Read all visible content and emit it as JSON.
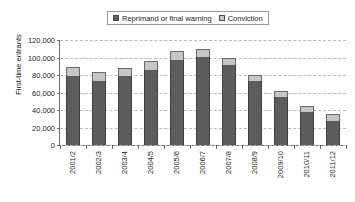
{
  "chart_data": {
    "type": "bar",
    "subtype": "stacked-bar",
    "title": "",
    "xlabel": "",
    "ylabel": "First-time entrants",
    "ylim": [
      0,
      120000
    ],
    "ytick_labels": [
      "120,000",
      "100,000",
      "80,000",
      "60,000",
      "40,000",
      "20,000",
      "0"
    ],
    "ytick_values": [
      120000,
      100000,
      80000,
      60000,
      40000,
      20000,
      0
    ],
    "grid": true,
    "legend_position": "top-center",
    "categories": [
      "2001/2",
      "2002/3",
      "2003/4",
      "2004/5",
      "2005/6",
      "2006/7",
      "2007/8",
      "2008/9",
      "2009/10",
      "2010/11",
      "2011/12"
    ],
    "series": [
      {
        "name": "Reprimand or final warning",
        "color": "#5d5d5d",
        "values": [
          79000,
          73000,
          79000,
          86000,
          97000,
          101000,
          91000,
          73000,
          55000,
          38000,
          28000
        ]
      },
      {
        "name": "Conviction",
        "color": "#c6c6c6",
        "values": [
          10000,
          10000,
          9000,
          10000,
          10000,
          9000,
          9000,
          7000,
          7000,
          7000,
          8000
        ]
      }
    ],
    "totals": [
      89000,
      83000,
      88000,
      96000,
      107000,
      110000,
      100000,
      80000,
      62000,
      45000,
      36000
    ]
  },
  "legend": {
    "items": [
      {
        "label": "Reprimand or final warning"
      },
      {
        "label": "Conviction"
      }
    ]
  },
  "axes": {
    "y_title": "First-time entrants"
  },
  "colors": {
    "series_reprimand": "#5d5d5d",
    "series_conviction": "#c6c6c6",
    "axis": "#6d6d6d",
    "gridline": "#b9b9b9",
    "background": "#ffffff"
  }
}
